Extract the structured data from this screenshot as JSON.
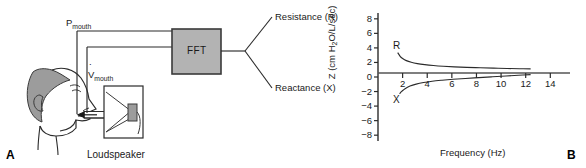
{
  "figure": {
    "panels": [
      {
        "letter": "A",
        "caption": "Loudspeaker",
        "signals": [
          {
            "name": "pressure-signal",
            "base": "P",
            "sub": "mouth"
          },
          {
            "name": "flow-signal",
            "base": "V",
            "sub": "mouth",
            "dot": true
          }
        ],
        "processor": {
          "label": "FFT",
          "fill": "#b3b3b3",
          "stroke": "#3a3a3a"
        },
        "outputs": [
          {
            "label": "Resistance (R)"
          },
          {
            "label": "Reactance (X)"
          }
        ]
      },
      {
        "letter": "B"
      }
    ]
  },
  "chart_data": {
    "type": "line",
    "title": "",
    "xlabel": "Frequency (Hz)",
    "ylabel": "Z (cm H2O/L/sec)",
    "ylabel_parts": {
      "pre": "Z (cm H",
      "sub": "2",
      "post": "O/L/sec)"
    },
    "xlim": [
      0,
      15.6
    ],
    "ylim": [
      -8.8,
      8.8
    ],
    "xticks": [
      2,
      4,
      6,
      8,
      10,
      12,
      14
    ],
    "yticks": [
      8,
      6,
      4,
      2,
      0,
      -2,
      -4,
      -6,
      -8
    ],
    "ytick_labels": [
      "8",
      "6",
      "4",
      "2",
      "0",
      "−2",
      "−4",
      "−6",
      "−8"
    ],
    "xtick_labels": [
      "2",
      "4",
      "6",
      "8",
      "10",
      "12",
      "14"
    ],
    "grid": false,
    "zero_line": true,
    "legend": "inline-annotations",
    "series": [
      {
        "name": "R",
        "annotation": "Resistance",
        "color": "#2b2b2b",
        "x": [
          1.6,
          1.8,
          2.0,
          2.3,
          2.7,
          3.2,
          3.8,
          4.5,
          5.3,
          6.2,
          7.2,
          8.3,
          9.4,
          10.5,
          11.5,
          12.4
        ],
        "y": [
          3.35,
          2.85,
          2.55,
          2.25,
          2.02,
          1.84,
          1.7,
          1.58,
          1.48,
          1.4,
          1.33,
          1.27,
          1.22,
          1.17,
          1.14,
          1.12
        ]
      },
      {
        "name": "X",
        "annotation": "Reactance",
        "color": "#2b2b2b",
        "x": [
          1.75,
          1.95,
          2.2,
          2.6,
          3.1,
          3.7,
          4.4,
          5.2,
          6.1,
          7.1,
          8.2,
          9.3,
          10.4,
          11.4,
          12.4
        ],
        "y": [
          -2.3,
          -1.95,
          -1.6,
          -1.25,
          -0.98,
          -0.76,
          -0.58,
          -0.44,
          -0.31,
          -0.2,
          -0.08,
          0.03,
          0.14,
          0.24,
          0.33
        ]
      }
    ],
    "series_labels": [
      {
        "text": "R",
        "x": 1.55,
        "y": 4.1
      },
      {
        "text": "X",
        "x": 1.55,
        "y": -3.35
      }
    ]
  }
}
